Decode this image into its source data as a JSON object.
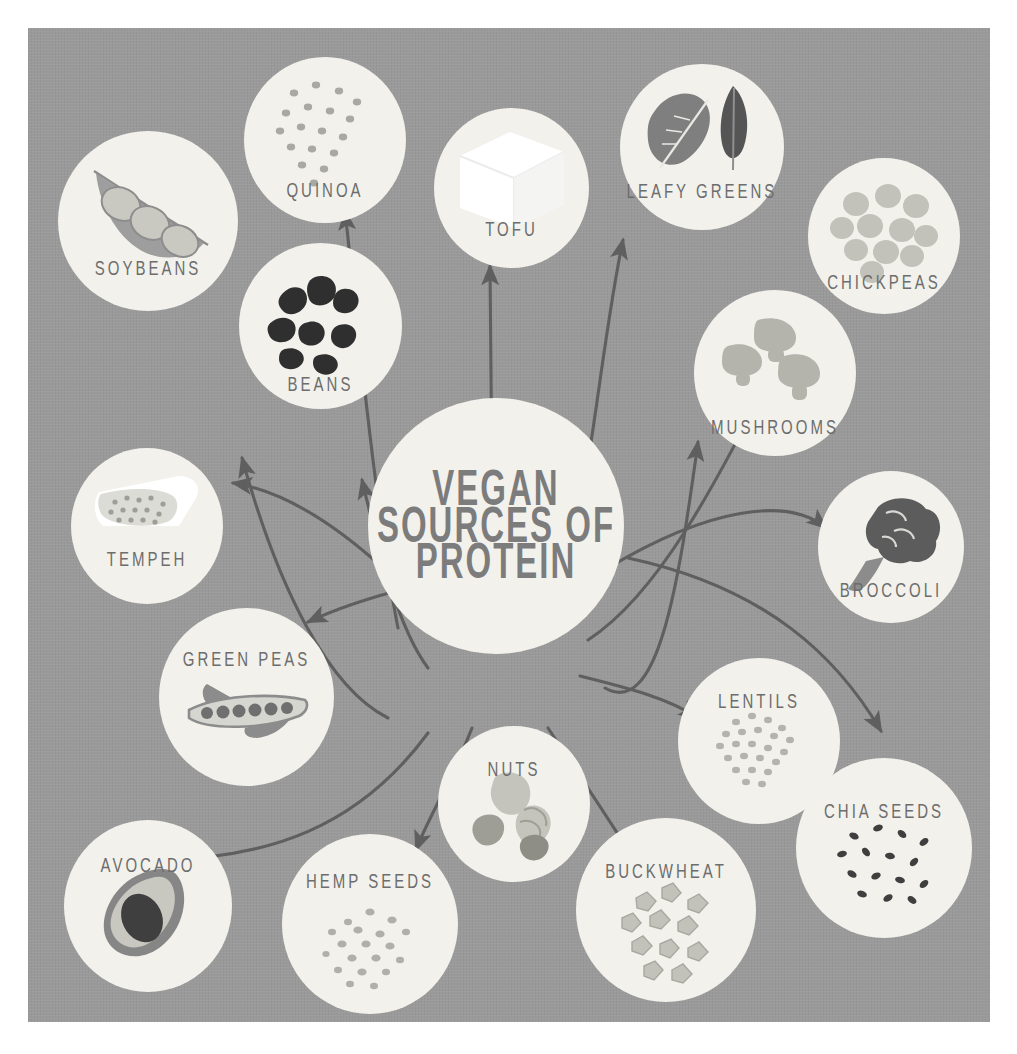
{
  "poster": {
    "background_color": "#9a9a9a",
    "node_fill": "#f2f1ec",
    "label_color": "#6d6d6d",
    "title_color": "#7c7c7c",
    "arrow_color": "#5f5f5f",
    "page_background": "#ffffff"
  },
  "center": {
    "line1": "VEGAN",
    "line2": "SOURCES OF",
    "line3": "PROTEIN"
  },
  "nodes": [
    {
      "id": "soybeans",
      "label": "SOYBEANS",
      "icon": "soybean-pod-icon"
    },
    {
      "id": "quinoa",
      "label": "QUINOA",
      "icon": "quinoa-grains-icon"
    },
    {
      "id": "tofu",
      "label": "TOFU",
      "icon": "tofu-cube-icon"
    },
    {
      "id": "leafy-greens",
      "label": "LEAFY GREENS",
      "icon": "leaf-pair-icon"
    },
    {
      "id": "chickpeas",
      "label": "CHICKPEAS",
      "icon": "chickpeas-icon"
    },
    {
      "id": "beans",
      "label": "BEANS",
      "icon": "kidney-beans-icon"
    },
    {
      "id": "mushrooms",
      "label": "MUSHROOMS",
      "icon": "mushrooms-icon"
    },
    {
      "id": "broccoli",
      "label": "BROCCOLI",
      "icon": "broccoli-icon"
    },
    {
      "id": "tempeh",
      "label": "TEMPEH",
      "icon": "tempeh-block-icon"
    },
    {
      "id": "green-peas",
      "label": "GREEN PEAS",
      "icon": "pea-pod-icon"
    },
    {
      "id": "lentils",
      "label": "LENTILS",
      "icon": "lentils-icon"
    },
    {
      "id": "chia-seeds",
      "label": "CHIA SEEDS",
      "icon": "chia-seeds-icon"
    },
    {
      "id": "avocado",
      "label": "AVOCADO",
      "icon": "avocado-half-icon"
    },
    {
      "id": "hemp-seeds",
      "label": "HEMP SEEDS",
      "icon": "hemp-seeds-icon"
    },
    {
      "id": "nuts",
      "label": "NUTS",
      "icon": "mixed-nuts-icon"
    },
    {
      "id": "buckwheat",
      "label": "BUCKWHEAT",
      "icon": "buckwheat-groats-icon"
    }
  ]
}
